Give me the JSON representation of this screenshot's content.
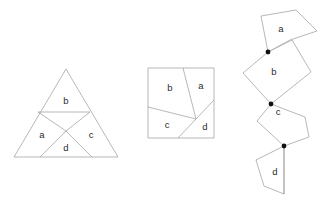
{
  "page": {
    "background_color": "#ffffff",
    "stroke_color": "#9a9a9a",
    "label_color": "#2b2b2b",
    "joint_color": "#111111",
    "width": 326,
    "height": 212
  },
  "figures": [
    {
      "id": "triangle-figure",
      "name": "equilateral-triangle-dissection",
      "outline": "14,157 118,157 66,69",
      "cuts": [
        "M 38,112 L 90,112",
        "M 38,112 L 66,131",
        "M 90,112 L 66,131",
        "M 66,131 L 40,157",
        "M 66,131 L 92,157"
      ],
      "pieces": [
        {
          "label": "a",
          "label_x": 42,
          "label_y": 135
        },
        {
          "label": "b",
          "label_x": 66,
          "label_y": 101
        },
        {
          "label": "c",
          "label_x": 91,
          "label_y": 135
        },
        {
          "label": "d",
          "label_x": 66,
          "label_y": 148
        }
      ]
    },
    {
      "id": "square-figure",
      "name": "square-dissection",
      "outline": "148,68 214,68 214,138 148,138",
      "cuts": [
        "M 183,68 L 196,119",
        "M 196,119 L 148,107",
        "M 196,119 L 214,100",
        "M 196,119 L 178,138"
      ],
      "pieces": [
        {
          "label": "a",
          "label_x": 201,
          "label_y": 86
        },
        {
          "label": "b",
          "label_x": 170,
          "label_y": 88
        },
        {
          "label": "c",
          "label_x": 167,
          "label_y": 125
        },
        {
          "label": "d",
          "label_x": 205,
          "label_y": 127
        }
      ]
    },
    {
      "id": "chain-figure",
      "name": "hinged-piece-chain",
      "pieces": [
        {
          "label": "a",
          "label_x": 281,
          "label_y": 29,
          "outline": "268,52 261,16 296,10 317,31 290,40"
        },
        {
          "label": "b",
          "label_x": 274,
          "label_y": 72,
          "outline": "268,52 292,40 311,72 271,104 243,73"
        },
        {
          "label": "c",
          "label_x": 278,
          "label_y": 112,
          "outline": "271,104 305,117 309,137 284,146 257,121"
        },
        {
          "label": "d",
          "label_x": 275,
          "label_y": 172,
          "outline": "284,146 284,194 264,186 256,160"
        }
      ],
      "joints": [
        {
          "cx": 268,
          "cy": 52,
          "r": 2.4
        },
        {
          "cx": 271,
          "cy": 104,
          "r": 2.4
        },
        {
          "cx": 284,
          "cy": 146,
          "r": 2.4
        }
      ],
      "stub_lines": [
        "M 284,146 L 284,194"
      ]
    }
  ]
}
